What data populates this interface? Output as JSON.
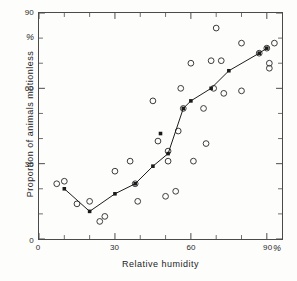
{
  "chart_data": {
    "type": "scatter",
    "title": "",
    "xlabel": "Relative humidity",
    "ylabel": "Proportion of animals motionless",
    "x_unit": "%",
    "y_unit": "%",
    "xlim": [
      0,
      96
    ],
    "ylim": [
      0,
      90
    ],
    "xticks": [
      0,
      30,
      60,
      90
    ],
    "yticks": [
      0,
      30,
      60,
      90
    ],
    "x_minor_tick_step": 10,
    "y_minor_tick_step": 10,
    "grid": false,
    "legend": "none",
    "series": [
      {
        "name": "Individual observations",
        "marker": "open-circle",
        "marker_color": "#3a3a3a",
        "points": [
          [
            7,
            22
          ],
          [
            10,
            23
          ],
          [
            15,
            14
          ],
          [
            20,
            15
          ],
          [
            24,
            7
          ],
          [
            26,
            9
          ],
          [
            30,
            27
          ],
          [
            36,
            31
          ],
          [
            38,
            22
          ],
          [
            39,
            15
          ],
          [
            45,
            55
          ],
          [
            47,
            39
          ],
          [
            50,
            17
          ],
          [
            51,
            35
          ],
          [
            51,
            31
          ],
          [
            54,
            19
          ],
          [
            55,
            43
          ],
          [
            56,
            60
          ],
          [
            57,
            52
          ],
          [
            60,
            70
          ],
          [
            61,
            31
          ],
          [
            65,
            52
          ],
          [
            66,
            38
          ],
          [
            68,
            71
          ],
          [
            69,
            60
          ],
          [
            70,
            84
          ],
          [
            72,
            71
          ],
          [
            73,
            58
          ],
          [
            80,
            78
          ],
          [
            80,
            59
          ],
          [
            87,
            74
          ],
          [
            90,
            76
          ],
          [
            91,
            70
          ],
          [
            91,
            68
          ],
          [
            93,
            78
          ]
        ]
      },
      {
        "name": "Mean trend",
        "marker": "filled-square",
        "marker_color": "#1a1a1a",
        "line": true,
        "points": [
          [
            10,
            20
          ],
          [
            20,
            11
          ],
          [
            30,
            18
          ],
          [
            38,
            22
          ],
          [
            45,
            29
          ],
          [
            51,
            34
          ],
          [
            57,
            52
          ],
          [
            60,
            55
          ],
          [
            68,
            60
          ],
          [
            75,
            67
          ],
          [
            87,
            74
          ],
          [
            90,
            76
          ]
        ]
      },
      {
        "name": "Isolated mean marker",
        "marker": "filled-square",
        "marker_color": "#1a1a1a",
        "line": false,
        "points": [
          [
            48,
            42
          ]
        ]
      }
    ]
  },
  "axes": {
    "y_tick_labels": [
      "0",
      "30",
      "60",
      "90"
    ],
    "x_tick_labels": [
      "0",
      "30",
      "60",
      "90"
    ],
    "y_percent_symbol": "%",
    "x_percent_symbol": "%"
  }
}
